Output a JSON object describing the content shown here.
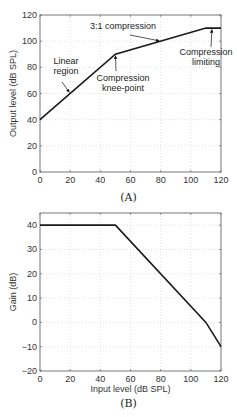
{
  "chart_data": [
    {
      "type": "line",
      "panel": "A",
      "caption": "(A)",
      "title": "",
      "xlabel": "",
      "ylabel": "Output level (dB SPL)",
      "xlim": [
        0,
        120
      ],
      "ylim": [
        0,
        120
      ],
      "xticks": [
        0,
        20,
        40,
        60,
        80,
        100,
        120
      ],
      "yticks": [
        0,
        20,
        40,
        60,
        80,
        100,
        120
      ],
      "grid": true,
      "series": [
        {
          "name": "Output level",
          "x": [
            0,
            50,
            110,
            120
          ],
          "y": [
            40,
            90,
            110,
            110
          ]
        }
      ],
      "annotations": [
        {
          "text": [
            "Linear",
            "region"
          ],
          "arrow_to": [
            20,
            60
          ]
        },
        {
          "text": [
            "3:1 compression"
          ],
          "arrow_to": [
            80,
            100
          ]
        },
        {
          "text": [
            "Compression",
            "knee-point"
          ],
          "arrow_to": [
            50,
            90
          ]
        },
        {
          "text": [
            "Compression",
            "limiting"
          ],
          "arrow_to": [
            114,
            110
          ]
        }
      ]
    },
    {
      "type": "line",
      "panel": "B",
      "caption": "(B)",
      "title": "",
      "xlabel": "Input level (dB SPL)",
      "ylabel": "Gain (dB)",
      "xlim": [
        0,
        120
      ],
      "ylim": [
        -20,
        45
      ],
      "xticks": [
        0,
        20,
        40,
        60,
        80,
        100,
        120
      ],
      "yticks": [
        -20,
        -10,
        0,
        10,
        20,
        30,
        40
      ],
      "grid": true,
      "series": [
        {
          "name": "Gain",
          "x": [
            0,
            50,
            110,
            120
          ],
          "y": [
            40,
            40,
            0,
            -10
          ]
        }
      ]
    }
  ]
}
